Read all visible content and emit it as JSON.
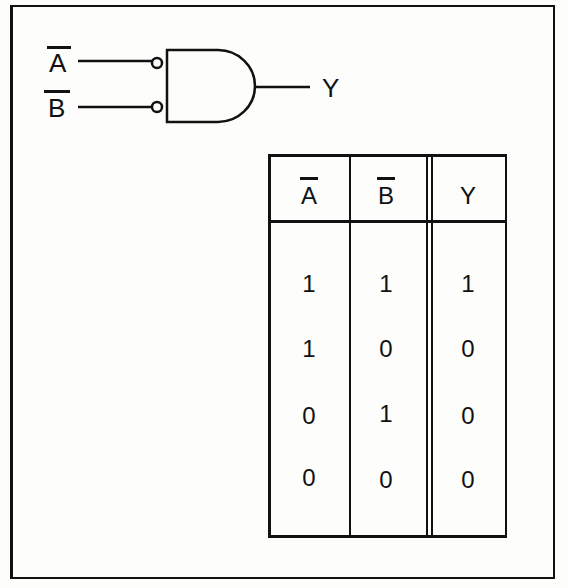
{
  "gate": {
    "type": "AND gate with inverted (bubbled) inputs",
    "inputs": [
      {
        "label": "A",
        "overbar": true
      },
      {
        "label": "B",
        "overbar": true
      }
    ],
    "output": {
      "label": "Y"
    }
  },
  "truth_table": {
    "headers": [
      "A",
      "B",
      "Y"
    ],
    "header_overbar": [
      true,
      true,
      false
    ],
    "rows": [
      [
        "1",
        "1",
        "1"
      ],
      [
        "1",
        "0",
        "0"
      ],
      [
        "0",
        "1",
        "0"
      ],
      [
        "0",
        "0",
        "0"
      ]
    ]
  }
}
